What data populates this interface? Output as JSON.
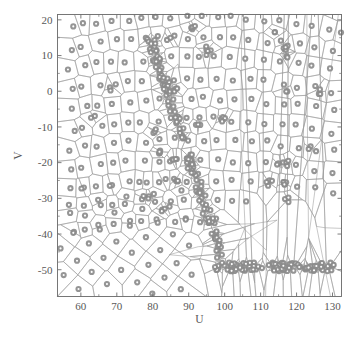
{
  "chart_data": {
    "type": "scatter",
    "title": "",
    "subtitle": "",
    "xlabel": "U",
    "ylabel": "V",
    "xlim": [
      53.5,
      132.5
    ],
    "ylim": [
      -57.5,
      21.5
    ],
    "xticks": [
      60,
      70,
      80,
      90,
      100,
      110,
      120,
      130
    ],
    "xtick_labels": [
      "60",
      "70",
      "80",
      "90",
      "100",
      "110",
      "120",
      "130"
    ],
    "yticks": [
      20,
      10,
      0,
      -10,
      -20,
      -30,
      -40,
      -50
    ],
    "ytick_labels": [
      "20",
      "10",
      "0",
      "-10",
      "-20",
      "-30",
      "-40",
      "-50"
    ],
    "grid": false,
    "legend": null,
    "annotations": [],
    "overlay": "voronoi-tessellation",
    "marker": {
      "shape": "circle-dot",
      "fill": "#8c8c8c",
      "edge": "#8c8c8c",
      "size": 3.1
    },
    "cell_edge_color": "#9a9a9a",
    "axis_color": "#6e6e6e",
    "background": "#ffffff",
    "series": [
      {
        "name": "sites",
        "description": "Voronoi generator points: quasi-regular lattice over the U-V plane with dense clustered bands along a lower-right diagonal and a horizontal band near V = -50.",
        "x": [
          57.2,
          57.5,
          57.1,
          57.8,
          57.3,
          57.6,
          57.2,
          57.9,
          57.4,
          57.1,
          57.7,
          61.0,
          60.4,
          61.3,
          60.8,
          61.6,
          60.2,
          61.1,
          60.7,
          61.4,
          60.9,
          61.2,
          64.8,
          65.3,
          64.5,
          65.1,
          64.9,
          65.4,
          64.6,
          65.2,
          64.7,
          65.0,
          65.5,
          68.9,
          69.4,
          68.6,
          69.2,
          68.8,
          69.5,
          68.7,
          69.1,
          69.3,
          68.5,
          69.0,
          73.0,
          73.5,
          72.7,
          73.2,
          73.8,
          72.9,
          73.4,
          73.1,
          73.6,
          72.8,
          73.3,
          77.1,
          77.6,
          76.8,
          77.3,
          77.9,
          77.0,
          77.5,
          77.2,
          77.7,
          76.9,
          77.4,
          81.2,
          81.7,
          80.9,
          81.4,
          82.0,
          81.1,
          81.6,
          81.3,
          81.8,
          81.0,
          81.5,
          85.3,
          85.8,
          85.0,
          85.5,
          86.1,
          85.2,
          85.7,
          85.4,
          85.9,
          85.1,
          85.6,
          89.4,
          89.9,
          89.1,
          89.6,
          90.2,
          89.3,
          89.8,
          89.5,
          90.0,
          89.2,
          89.7,
          93.5,
          94.0,
          93.2,
          93.7,
          94.3,
          93.4,
          93.9,
          93.6,
          94.1,
          93.3,
          93.8,
          97.6,
          98.1,
          97.3,
          97.8,
          98.4,
          97.5,
          98.0,
          97.7,
          98.2,
          97.4,
          97.9,
          102.0,
          102.5,
          101.7,
          102.2,
          102.8,
          101.9,
          102.4,
          102.1,
          102.6,
          101.8,
          106.5,
          107.0,
          106.2,
          106.7,
          107.3,
          106.4,
          106.9,
          106.6,
          107.1,
          106.3,
          111.0,
          111.5,
          110.7,
          111.2,
          111.8,
          110.9,
          111.4,
          111.1,
          111.6,
          115.6,
          116.1,
          115.3,
          115.8,
          116.4,
          115.5,
          116.0,
          115.7,
          116.2,
          120.2,
          120.7,
          119.9,
          120.4,
          121.0,
          120.1,
          120.6,
          120.3,
          120.8,
          124.8,
          125.3,
          124.5,
          125.0,
          125.6,
          124.7,
          125.2,
          124.9,
          125.4,
          129.4,
          129.9,
          129.1,
          129.6,
          130.2,
          129.3,
          129.8,
          129.5,
          130.0
        ],
        "y": [
          17.8,
          12.1,
          6.4,
          0.7,
          -5.0,
          -10.7,
          -16.4,
          -22.1,
          -27.8,
          -33.5,
          -39.2,
          18.6,
          12.9,
          7.2,
          1.5,
          -4.2,
          -9.9,
          -15.6,
          -21.3,
          -27.0,
          -32.7,
          -38.4,
          19.2,
          13.5,
          7.8,
          2.1,
          -3.6,
          -9.3,
          -15.0,
          -20.7,
          -26.4,
          -32.1,
          -37.8,
          19.7,
          14.0,
          8.3,
          2.6,
          -3.1,
          -8.8,
          -14.5,
          -20.2,
          -25.9,
          -31.6,
          -37.3,
          20.1,
          14.4,
          8.7,
          3.0,
          -2.7,
          -8.4,
          -14.1,
          -19.8,
          -25.5,
          -31.2,
          -36.9,
          20.4,
          14.7,
          9.0,
          3.3,
          -2.4,
          -8.1,
          -13.8,
          -19.5,
          -25.2,
          -30.9,
          -36.6,
          20.6,
          14.9,
          9.2,
          3.5,
          -2.2,
          -7.9,
          -13.6,
          -19.3,
          -25.0,
          -30.7,
          -36.4,
          20.7,
          15.0,
          9.3,
          3.6,
          -2.1,
          -7.8,
          -13.5,
          -19.2,
          -24.9,
          -30.6,
          -36.3,
          20.8,
          15.1,
          9.4,
          3.7,
          -2.0,
          -7.7,
          -13.4,
          -19.1,
          -24.8,
          -30.5,
          -36.2,
          20.8,
          15.1,
          9.4,
          3.7,
          -2.0,
          -7.7,
          -13.4,
          -19.1,
          -24.8,
          -30.5,
          -36.2,
          20.7,
          15.0,
          9.3,
          3.6,
          -2.1,
          -7.8,
          -13.5,
          -19.2,
          -24.9,
          -30.6,
          -36.3,
          20.5,
          14.8,
          9.1,
          3.4,
          -2.3,
          -8.0,
          -13.7,
          -19.4,
          -25.1,
          -30.8,
          20.2,
          14.5,
          8.8,
          3.1,
          -2.6,
          -8.3,
          -14.0,
          -19.7,
          -25.4,
          -31.1,
          19.8,
          14.1,
          8.4,
          2.7,
          -3.0,
          -8.7,
          -14.4,
          -20.1,
          -25.8,
          19.3,
          13.6,
          7.9,
          2.2,
          -3.5,
          -9.2,
          -14.9,
          -20.6,
          -26.3,
          18.7,
          13.0,
          7.3,
          1.6,
          -4.1,
          -9.8,
          -15.5,
          -21.2,
          -26.9,
          18.0,
          12.3,
          6.6,
          0.9,
          -4.8,
          -10.5,
          -16.2,
          -21.9,
          -27.6,
          17.2,
          11.5,
          5.8,
          0.1,
          -5.6,
          -11.3,
          -17.0,
          -22.7,
          -28.4
        ],
        "clusters": [
          {
            "name": "diagonal-band",
            "u_range": [
              78,
              100
            ],
            "v_range": [
              -48,
              18
            ],
            "density": "high"
          },
          {
            "name": "lower-horizontal-band",
            "u_range": [
              96,
              131
            ],
            "v_range": [
              -51,
              -47
            ],
            "density": "high"
          },
          {
            "name": "bottom-left-lattice",
            "u_range": [
              54,
              85
            ],
            "v_range": [
              -56,
              -26
            ],
            "density": "regular"
          },
          {
            "name": "right-fan",
            "u_range": [
              100,
              132
            ],
            "v_range": [
              -20,
              21
            ],
            "density": "sparse"
          }
        ]
      }
    ]
  },
  "figure": {
    "name": "voronoi-tessellation-plot"
  }
}
